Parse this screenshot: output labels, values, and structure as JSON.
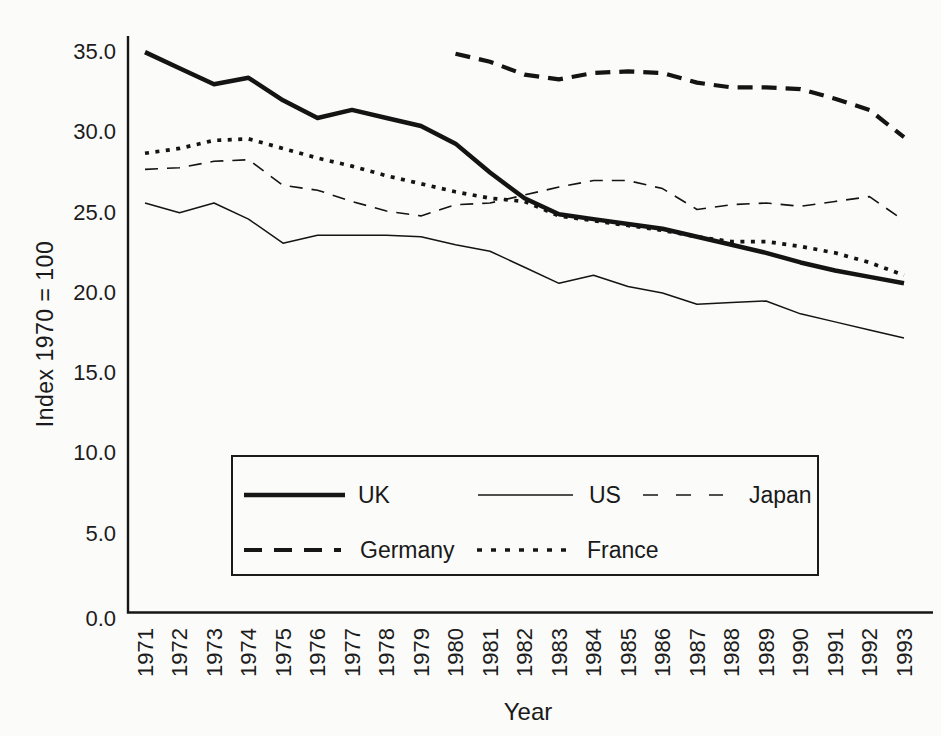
{
  "figure": {
    "kind": "scanned black-and-white line chart from a book page",
    "background": "#fbfbfa",
    "ink_color": "#1a1a1a"
  },
  "chart_data": {
    "type": "line",
    "title": "",
    "xlabel": "Year",
    "ylabel": "Index 1970 = 100",
    "x": [
      1971,
      1972,
      1973,
      1974,
      1975,
      1976,
      1977,
      1978,
      1979,
      1980,
      1981,
      1982,
      1983,
      1984,
      1985,
      1986,
      1987,
      1988,
      1989,
      1990,
      1991,
      1992,
      1993
    ],
    "y_tick_labels": [
      "35.0",
      "30.0",
      "25.0",
      "20.0",
      "15.0",
      "10.0",
      "5.0",
      "0.0"
    ],
    "ylim": [
      0,
      36.5
    ],
    "grid": false,
    "legend_position": "boxed legend inside plot, lower center, two rows",
    "series": [
      {
        "name": "UK",
        "line_style": "thick-solid",
        "values": [
          34.9,
          33.9,
          32.9,
          33.3,
          31.9,
          30.8,
          31.3,
          30.8,
          30.3,
          29.2,
          27.4,
          25.8,
          24.8,
          24.5,
          24.2,
          23.9,
          23.4,
          22.9,
          22.4,
          21.8,
          21.3,
          20.9,
          20.5
        ]
      },
      {
        "name": "US",
        "line_style": "thin-solid",
        "values": [
          25.5,
          24.9,
          25.5,
          24.5,
          23.0,
          23.5,
          23.5,
          23.5,
          23.4,
          22.9,
          22.5,
          21.5,
          20.5,
          21.0,
          20.3,
          19.9,
          19.2,
          19.3,
          19.4,
          18.6,
          18.1,
          17.6,
          17.1
        ]
      },
      {
        "name": "Japan",
        "line_style": "thin-dashed",
        "values": [
          27.6,
          27.7,
          28.1,
          28.2,
          26.6,
          26.3,
          25.6,
          25.0,
          24.7,
          25.4,
          25.5,
          26.0,
          26.5,
          26.9,
          26.9,
          26.4,
          25.1,
          25.4,
          25.5,
          25.3,
          25.6,
          25.9,
          24.4
        ]
      },
      {
        "name": "Germany",
        "line_style": "thick-dashed",
        "values": [
          null,
          null,
          null,
          null,
          null,
          null,
          null,
          null,
          null,
          34.8,
          34.3,
          33.5,
          33.2,
          33.6,
          33.7,
          33.6,
          33.0,
          32.7,
          32.7,
          32.6,
          32.0,
          31.3,
          29.6
        ]
      },
      {
        "name": "France",
        "line_style": "thick-dotted",
        "values": [
          28.6,
          28.9,
          29.4,
          29.5,
          28.9,
          28.3,
          27.8,
          27.2,
          26.7,
          26.2,
          25.8,
          25.6,
          24.7,
          24.4,
          24.1,
          23.8,
          23.4,
          23.1,
          23.1,
          22.8,
          22.4,
          21.8,
          21.0
        ]
      }
    ]
  }
}
